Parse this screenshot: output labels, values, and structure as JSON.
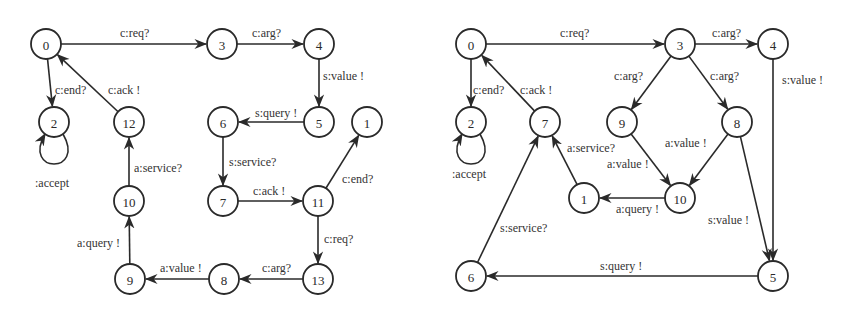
{
  "diagrams": [
    {
      "name": "left-automaton",
      "nodes": [
        {
          "id": "0",
          "x": 46,
          "y": 44
        },
        {
          "id": "3",
          "x": 222,
          "y": 44
        },
        {
          "id": "4",
          "x": 319,
          "y": 44
        },
        {
          "id": "2",
          "x": 54,
          "y": 122
        },
        {
          "id": "12",
          "x": 129,
          "y": 122
        },
        {
          "id": "6",
          "x": 223,
          "y": 122
        },
        {
          "id": "5",
          "x": 319,
          "y": 122
        },
        {
          "id": "1",
          "x": 367,
          "y": 122
        },
        {
          "id": "10",
          "x": 129,
          "y": 201
        },
        {
          "id": "7",
          "x": 223,
          "y": 201
        },
        {
          "id": "11",
          "x": 318,
          "y": 201
        },
        {
          "id": "9",
          "x": 130,
          "y": 279
        },
        {
          "id": "8",
          "x": 224,
          "y": 279
        },
        {
          "id": "13",
          "x": 318,
          "y": 279
        }
      ],
      "edges": [
        {
          "from": "0",
          "to": "3",
          "label": "c:req?",
          "lx": 120,
          "ly": 37
        },
        {
          "from": "3",
          "to": "4",
          "label": "c:arg?",
          "lx": 252,
          "ly": 37
        },
        {
          "from": "4",
          "to": "5",
          "label": "s:value !",
          "lx": 323,
          "ly": 80
        },
        {
          "from": "5",
          "to": "6",
          "label": "s:query !",
          "lx": 255,
          "ly": 117
        },
        {
          "from": "6",
          "to": "7",
          "label": "s:service?",
          "lx": 229,
          "ly": 166
        },
        {
          "from": "7",
          "to": "11",
          "label": "c:ack !",
          "lx": 253,
          "ly": 195
        },
        {
          "from": "11",
          "to": "1",
          "label": "c:end?",
          "lx": 342,
          "ly": 183
        },
        {
          "from": "11",
          "to": "13",
          "label": "c:req?",
          "lx": 324,
          "ly": 243
        },
        {
          "from": "13",
          "to": "8",
          "label": "c:arg?",
          "lx": 262,
          "ly": 272
        },
        {
          "from": "8",
          "to": "9",
          "label": "a:value !",
          "lx": 160,
          "ly": 272
        },
        {
          "from": "9",
          "to": "10",
          "label": "a:query !",
          "lx": 77,
          "ly": 247
        },
        {
          "from": "10",
          "to": "12",
          "label": "a:service?",
          "lx": 134,
          "ly": 172
        },
        {
          "from": "12",
          "to": "0",
          "label": "c:ack !",
          "lx": 108,
          "ly": 94
        },
        {
          "from": "0",
          "to": "2",
          "label": "c:end?",
          "lx": 55,
          "ly": 94
        }
      ],
      "self_loop": {
        "node": "2",
        "label": ":accept",
        "lx": 35,
        "ly": 187
      }
    },
    {
      "name": "right-automaton",
      "nodes": [
        {
          "id": "0",
          "x": 471,
          "y": 44
        },
        {
          "id": "3",
          "x": 680,
          "y": 44
        },
        {
          "id": "4",
          "x": 773,
          "y": 44
        },
        {
          "id": "2",
          "x": 471,
          "y": 122
        },
        {
          "id": "7",
          "x": 545,
          "y": 122
        },
        {
          "id": "9",
          "x": 622,
          "y": 122
        },
        {
          "id": "8",
          "x": 737,
          "y": 122
        },
        {
          "id": "1",
          "x": 584,
          "y": 198
        },
        {
          "id": "10",
          "x": 680,
          "y": 198
        },
        {
          "id": "6",
          "x": 471,
          "y": 276
        },
        {
          "id": "5",
          "x": 773,
          "y": 276
        }
      ],
      "edges": [
        {
          "from": "0",
          "to": "3",
          "label": "c:req?",
          "lx": 560,
          "ly": 37
        },
        {
          "from": "3",
          "to": "4",
          "label": "c:arg?",
          "lx": 712,
          "ly": 37
        },
        {
          "from": "3",
          "to": "9",
          "label": "c:arg?",
          "lx": 614,
          "ly": 80
        },
        {
          "from": "3",
          "to": "8",
          "label": "c:arg?",
          "lx": 710,
          "ly": 80
        },
        {
          "from": "9",
          "to": "10",
          "label": "a:value !",
          "lx": 607,
          "ly": 168
        },
        {
          "from": "8",
          "to": "10",
          "label": "a:value !",
          "lx": 665,
          "ly": 147
        },
        {
          "from": "10",
          "to": "1",
          "label": "a:query !",
          "lx": 616,
          "ly": 213
        },
        {
          "from": "1",
          "to": "7",
          "label": "a:service?",
          "lx": 567,
          "ly": 152
        },
        {
          "from": "7",
          "to": "0",
          "label": "c:ack !",
          "lx": 520,
          "ly": 94
        },
        {
          "from": "0",
          "to": "2",
          "label": "c:end?",
          "lx": 473,
          "ly": 94
        },
        {
          "from": "4",
          "to": "5",
          "label": "s:value !",
          "lx": 782,
          "ly": 84
        },
        {
          "from": "8",
          "to": "5",
          "label": "s:value !",
          "lx": 708,
          "ly": 224
        },
        {
          "from": "5",
          "to": "6",
          "label": "s:query !",
          "lx": 600,
          "ly": 270
        },
        {
          "from": "6",
          "to": "7",
          "label": "s:service?",
          "lx": 500,
          "ly": 232
        }
      ],
      "self_loop": {
        "node": "2",
        "label": ":accept",
        "lx": 452,
        "ly": 178
      }
    }
  ],
  "colors": {
    "stroke": "#2a2a2a",
    "background": "#ffffff",
    "text": "#333333"
  }
}
